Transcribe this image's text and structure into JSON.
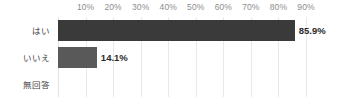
{
  "chart_data": {
    "type": "bar",
    "orientation": "horizontal",
    "title": "",
    "subtitle": "",
    "xlabel": "",
    "ylabel": "",
    "categories": [
      "はい",
      "いいえ",
      "無回答"
    ],
    "values": [
      85.9,
      14.1,
      0
    ],
    "value_labels": [
      "85.9%",
      "14.1%",
      ""
    ],
    "series": [
      {
        "name": "",
        "values": [
          85.9,
          14.1,
          0
        ]
      }
    ],
    "xlim": [
      0,
      90
    ],
    "xticks": [
      10,
      20,
      30,
      40,
      50,
      60,
      70,
      80,
      90
    ],
    "xtick_labels": [
      "10%",
      "20%",
      "30%",
      "40%",
      "50%",
      "60%",
      "70%",
      "80%",
      "90%"
    ],
    "grid": true,
    "grid_axis": "x",
    "legend": false,
    "legend_position": "none",
    "bar_colors": [
      "#3a3a3a",
      "#595959",
      "#595959"
    ],
    "grid_color": "#e9e9e9",
    "tick_label_color": "#8d8d8d",
    "category_label_color": "#3f3f3f",
    "value_label_color": "#2b2b2b",
    "background": "#ffffff"
  }
}
